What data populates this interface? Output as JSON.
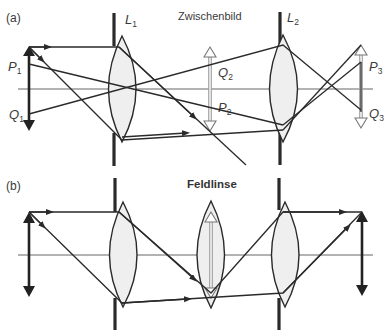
{
  "panel_a": {
    "label": "(a)",
    "title": "Zwischenbild",
    "lens1": {
      "name": "L",
      "sub": "1"
    },
    "lens2": {
      "name": "L",
      "sub": "2"
    },
    "points": [
      {
        "name": "P",
        "sub": "1"
      },
      {
        "name": "Q",
        "sub": "1"
      },
      {
        "name": "Q",
        "sub": "2"
      },
      {
        "name": "P",
        "sub": "2"
      },
      {
        "name": "P",
        "sub": "3"
      },
      {
        "name": "Q",
        "sub": "3"
      }
    ]
  },
  "panel_b": {
    "label": "(b)",
    "title": "Feldlinse"
  },
  "colors": {
    "ray": "#2a2a2a",
    "lens_fill": "#efefef",
    "image_arrow": "#9a9a9a",
    "background": "#ffffff"
  }
}
